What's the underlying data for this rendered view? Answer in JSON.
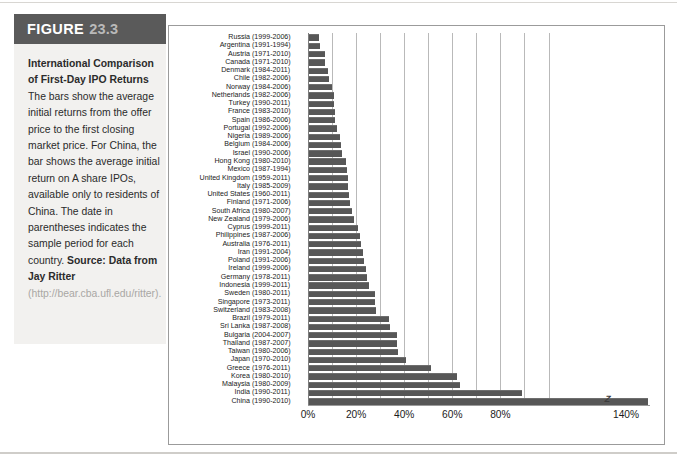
{
  "figure": {
    "banner_word": "FIGURE",
    "banner_number": "23.3",
    "title": "International Comparison of First-Day IPO Returns",
    "body": "The bars show the average initial returns from the offer price to the first closing market price. For China, the bar shows the average initial return on A share IPOs, available only to residents of China. The date in parentheses indicates the sample period for each country.",
    "source_label": "Source: Data from Jay Ritter",
    "source_url": "(http://bear.cba.ufl.edu/ritter)."
  },
  "colors": {
    "banner_bg": "#5a5a5a",
    "banner_word": "#ffffff",
    "banner_number": "#b9b9b9",
    "caption_bg": "#f2f1ef",
    "bar": "#575757",
    "grid": "#b9b9b9",
    "frame": "#9b9b9b",
    "url_gray": "#a9a7a4"
  },
  "chart_data": {
    "type": "bar",
    "orientation": "horizontal",
    "title": "International Comparison of First-Day IPO Returns",
    "xlabel": "",
    "ylabel": "",
    "xlim": [
      0,
      142
    ],
    "grid": true,
    "gridlines": [
      0,
      10,
      20,
      30,
      40,
      50,
      60,
      70,
      80,
      90,
      100
    ],
    "tick_labels": [
      "0%",
      "20%",
      "40%",
      "60%",
      "80%",
      "140%"
    ],
    "tick_values": [
      0,
      20,
      40,
      60,
      80,
      140
    ],
    "axis_break_after": 90,
    "break_marker": "zigzag",
    "categories": [
      "Russia",
      "Argentina",
      "Austria",
      "Canada",
      "Denmark",
      "Chile",
      "Norway",
      "Netherlands",
      "Turkey",
      "France",
      "Spain",
      "Portugal",
      "Nigeria",
      "Belgium",
      "Israel",
      "Hong Kong",
      "Mexico",
      "United Kingdom",
      "Italy",
      "United States",
      "Finland",
      "South Africa",
      "New Zealand",
      "Cyprus",
      "Philippines",
      "Australia",
      "Iran",
      "Poland",
      "Ireland",
      "Germany",
      "Indonesia",
      "Sweden",
      "Singapore",
      "Switzerland",
      "Brazil",
      "Sri Lanka",
      "Bulgaria",
      "Thailand",
      "Taiwan",
      "Japan",
      "Greece",
      "Korea",
      "Malaysia",
      "India",
      "China"
    ],
    "periods": [
      "(1999-2006)",
      "(1991-1994)",
      "(1971-2010)",
      "(1971-2010)",
      "(1984-2011)",
      "(1982-2006)",
      "(1984-2006)",
      "(1982-2006)",
      "(1990-2011)",
      "(1983-2010)",
      "(1986-2006)",
      "(1992-2006)",
      "(1989-2006)",
      "(1984-2006)",
      "(1990-2006)",
      "(1980-2010)",
      "(1987-1994)",
      "(1959-2011)",
      "(1985-2009)",
      "(1960-2011)",
      "(1971-2006)",
      "(1980-2007)",
      "(1979-2006)",
      "(1999-2011)",
      "(1987-2006)",
      "(1976-2011)",
      "(1991-2004)",
      "(1991-2006)",
      "(1999-2006)",
      "(1978-2011)",
      "(1999-2011)",
      "(1980-2011)",
      "(1973-2011)",
      "(1983-2008)",
      "(1979-2011)",
      "(1987-2008)",
      "(2004-2007)",
      "(1987-2007)",
      "(1980-2006)",
      "(1970-2010)",
      "(1976-2011)",
      "(1980-2010)",
      "(1980-2009)",
      "(1990-2011)",
      "(1990-2010)"
    ],
    "values": [
      4.2,
      4.4,
      6.5,
      6.8,
      8.1,
      8.4,
      9.6,
      10.2,
      10.6,
      10.7,
      10.9,
      11.6,
      12.7,
      13.5,
      13.8,
      15.4,
      15.9,
      16.3,
      16.4,
      16.8,
      17.2,
      18.0,
      18.6,
      20.3,
      21.2,
      21.8,
      22.4,
      22.9,
      23.6,
      24.2,
      25.0,
      27.3,
      27.4,
      28.0,
      33.1,
      33.5,
      36.5,
      36.6,
      37.2,
      40.2,
      50.8,
      61.6,
      62.6,
      88.5,
      137.4
    ],
    "note": "China bar is truncated at the axis break; actual value exceeds the plotted 140% mark."
  }
}
